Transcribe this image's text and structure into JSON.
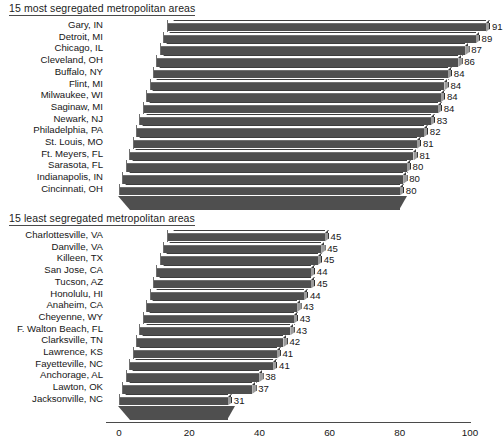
{
  "charts": [
    {
      "id": "most-segregated",
      "title": "15 most segregated metropolitan areas",
      "categories": [
        "Gary, IN",
        "Detroit, MI",
        "Chicago, IL",
        "Cleveland, OH",
        "Buffalo, NY",
        "Flint, MI",
        "Milwaukee, WI",
        "Saginaw, MI",
        "Newark, NJ",
        "Philadelphia, PA",
        "St. Louis, MO",
        "Ft. Meyers, FL",
        "Sarasota, FL",
        "Indianapolis, IN",
        "Cincinnati, OH"
      ],
      "values": [
        91,
        89,
        87,
        86,
        84,
        84,
        84,
        84,
        83,
        82,
        81,
        81,
        80,
        80,
        80
      ]
    },
    {
      "id": "least-segregated",
      "title": "15 least segregated metropolitan areas",
      "categories": [
        "Charlottesville, VA",
        "Danville, VA",
        "Killeen, TX",
        "San Jose, CA",
        "Tucson, AZ",
        "Honolulu, HI",
        "Anaheim, CA",
        "Cheyenne, WY",
        "F. Walton Beach, FL",
        "Clarksville, TN",
        "Lawrence, KS",
        "Fayetteville, NC",
        "Anchorage, AL",
        "Lawton, OK",
        "Jacksonville, NC"
      ],
      "values": [
        45,
        45,
        45,
        44,
        45,
        44,
        43,
        43,
        43,
        42,
        41,
        41,
        38,
        37,
        31
      ]
    }
  ],
  "axis": {
    "ticks": [
      "0",
      "20",
      "40",
      "60",
      "80",
      "100"
    ],
    "tick_values": [
      0,
      20,
      40,
      60,
      80,
      100
    ],
    "xmin": 0,
    "xmax": 100
  },
  "chart_data": [
    {
      "type": "bar",
      "orientation": "horizontal",
      "style": "3d",
      "title": "15 most segregated metropolitan areas",
      "categories": [
        "Gary, IN",
        "Detroit, MI",
        "Chicago, IL",
        "Cleveland, OH",
        "Buffalo, NY",
        "Flint, MI",
        "Milwaukee, WI",
        "Saginaw, MI",
        "Newark, NJ",
        "Philadelphia, PA",
        "St. Louis, MO",
        "Ft. Meyers, FL",
        "Sarasota, FL",
        "Indianapolis, IN",
        "Cincinnati, OH"
      ],
      "values": [
        91,
        89,
        87,
        86,
        84,
        84,
        84,
        84,
        83,
        82,
        81,
        81,
        80,
        80,
        80
      ],
      "xlabel": "",
      "ylabel": "",
      "xlim": [
        0,
        100
      ],
      "xticks": [
        0,
        20,
        40,
        60,
        80,
        100
      ],
      "grid": false,
      "legend": "none",
      "data_labels": true
    },
    {
      "type": "bar",
      "orientation": "horizontal",
      "style": "3d",
      "title": "15 least segregated metropolitan areas",
      "categories": [
        "Charlottesville, VA",
        "Danville, VA",
        "Killeen, TX",
        "San Jose, CA",
        "Tucson, AZ",
        "Honolulu, HI",
        "Anaheim, CA",
        "Cheyenne, WY",
        "F. Walton Beach, FL",
        "Clarksville, TN",
        "Lawrence, KS",
        "Fayetteville, NC",
        "Anchorage, AL",
        "Lawton, OK",
        "Jacksonville, NC"
      ],
      "values": [
        45,
        45,
        45,
        44,
        45,
        44,
        43,
        43,
        43,
        42,
        41,
        41,
        38,
        37,
        31
      ],
      "xlabel": "",
      "ylabel": "",
      "xlim": [
        0,
        100
      ],
      "xticks": [
        0,
        20,
        40,
        60,
        80,
        100
      ],
      "grid": false,
      "legend": "none",
      "data_labels": true
    }
  ],
  "colors": {
    "bar_front": "#4f4f4f",
    "bar_top": "#ffffff",
    "bar_side": "#9b9b9b",
    "text": "#161616",
    "axis": "#6e6e6e"
  }
}
